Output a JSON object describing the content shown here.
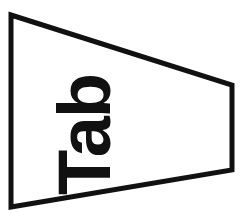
{
  "figure": {
    "label": "Tab",
    "label_rotation_degrees": -90,
    "shape": "pennant-trapezoid",
    "stroke_color": "#111111",
    "fill_color": "#ffffff",
    "background_color": "#ffffff",
    "text_color": "#111111",
    "outline_points": "11,15 232,85 232,170 11,207",
    "canvas": {
      "width": 251,
      "height": 224
    }
  }
}
